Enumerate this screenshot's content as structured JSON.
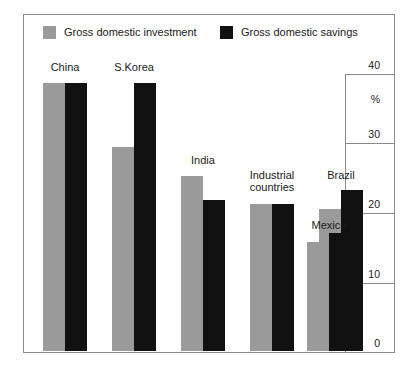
{
  "chart_data": {
    "type": "bar",
    "title": "",
    "subtitle": "",
    "xlabel": "",
    "ylabel": "%",
    "ylim": [
      0,
      40
    ],
    "yticks": [
      0,
      10,
      20,
      30,
      40
    ],
    "ytick_labels": [
      "0",
      "10",
      "20",
      "30",
      "40"
    ],
    "unit_label": "%",
    "grid": false,
    "legend_position": "top-left",
    "axis_side": "right",
    "categories": [
      "China",
      "S.Korea",
      "India",
      "Industrial countries",
      "Brazil",
      "Mexico"
    ],
    "series": [
      {
        "name": "Gross domestic investment",
        "color": "#9a9a9a",
        "values": [
          38.5,
          29.4,
          25.2,
          21.1,
          20.4,
          15.7
        ]
      },
      {
        "name": "Gross domestic savings",
        "color": "#111111",
        "values": [
          38.5,
          38.5,
          21.7,
          21.1,
          23.1,
          17.0
        ]
      }
    ]
  },
  "legend": {
    "entries": [
      {
        "label": "Gross domestic investment",
        "color": "#9a9a9a"
      },
      {
        "label": "Gross domestic savings",
        "color": "#111111"
      }
    ]
  },
  "labels": {
    "china": "China",
    "skorea": "S.Korea",
    "india": "India",
    "industrial_line1": "Industrial",
    "industrial_line2": "countries",
    "brazil": "Brazil",
    "mexico": "Mexico"
  },
  "axis": {
    "t40": "40",
    "t30": "30",
    "t20": "20",
    "t10": "10",
    "t0": "0",
    "percent": "%"
  },
  "colors": {
    "investment": "#9a9a9a",
    "savings": "#111111",
    "frame": "#8a8a8a",
    "text": "#1a1a1a",
    "background": "#ffffff"
  }
}
